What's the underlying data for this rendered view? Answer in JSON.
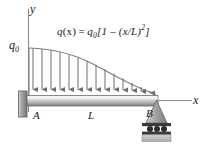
{
  "figure": {
    "kind": "beam-load-diagram",
    "width": 208,
    "height": 144,
    "background_color": "#ffffff"
  },
  "axes": {
    "y_label": "y",
    "x_label": "x",
    "y_axis_color": "#8a8a8a",
    "x_axis_color": "#8a8a8a"
  },
  "labels": {
    "support_left": "A",
    "span": "L",
    "support_right": "B",
    "load_intensity": "q",
    "load_intensity_sub": "0"
  },
  "equation": {
    "lhs_fn": "q",
    "lhs_arg": "(x)",
    "equals": "=",
    "rhs_q": "q",
    "rhs_q_sub": "0",
    "rhs_open": "[1 – (x/L)",
    "rhs_exp": "2",
    "rhs_close": "]",
    "plain": "q(x) = q0[1 - (x/L)^2]"
  },
  "load": {
    "arrow_count": 14,
    "arrow_color": "#6e6e6e",
    "curve_color": "#7a7a7a",
    "description": "parabolic distributed downward load, maximum q0 at A, zero at B"
  },
  "beam": {
    "color_top": "#f2f2f2",
    "color_mid": "#c9c9c9",
    "color_bottom": "#8e8e8e",
    "outline_color": "#6b6b6b"
  },
  "supports": {
    "wall_color": "#8f8f8f",
    "wall_outline": "#5e5e5e",
    "roller_triangle_color": "#9a9a9a",
    "roller_circle_color": "#2b2b2b",
    "ground_color": "#c0c0c0",
    "roller_count": 3
  },
  "colors": {
    "ink": "#1a1a1a",
    "gray_line": "#7a7a7a"
  }
}
